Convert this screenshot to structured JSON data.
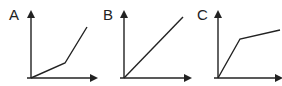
{
  "figure": {
    "panels": [
      {
        "label": "A",
        "shape": "piecewise linear, shallow slope then steep slope (concave up)",
        "origin": [
          31,
          78
        ],
        "y_axis_top": 10,
        "x_axis_end": 97,
        "points": [
          [
            31,
            78
          ],
          [
            65,
            63
          ],
          [
            87,
            27
          ]
        ]
      },
      {
        "label": "B",
        "shape": "straight line through origin (linear)",
        "origin": [
          124,
          78
        ],
        "y_axis_top": 10,
        "x_axis_end": 190,
        "points": [
          [
            124,
            78
          ],
          [
            183,
            17
          ]
        ]
      },
      {
        "label": "C",
        "shape": "piecewise linear, steep slope then shallow slope (concave down)",
        "origin": [
          218,
          78
        ],
        "y_axis_top": 10,
        "x_axis_end": 281,
        "points": [
          [
            218,
            78
          ],
          [
            240,
            39
          ],
          [
            280,
            30
          ]
        ]
      }
    ],
    "colors": {
      "line": "#222222",
      "background": "#ffffff"
    }
  }
}
